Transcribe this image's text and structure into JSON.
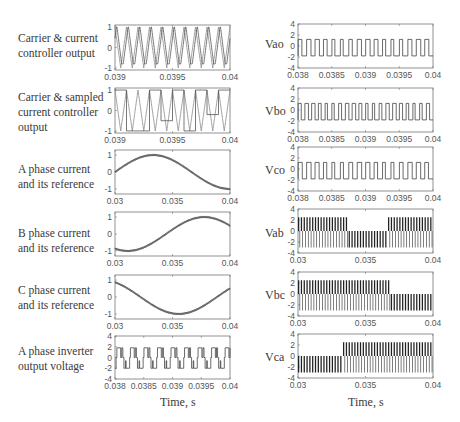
{
  "left_labels": [
    {
      "line1": "Carrier & current",
      "line2": "controller output",
      "line3": ""
    },
    {
      "line1": "Carrier & sampled",
      "line2": "current  controller",
      "line3": "output"
    },
    {
      "line1": "A phase current",
      "line2": "and its reference",
      "line3": ""
    },
    {
      "line1": "B phase current",
      "line2": "and its reference",
      "line3": ""
    },
    {
      "line1": "C phase current",
      "line2": "and its reference",
      "line3": ""
    },
    {
      "line1": "A phase inverter",
      "line2": "output voltage",
      "line3": ""
    }
  ],
  "right_labels": [
    "Vao",
    "Vbo",
    "Vco",
    "Vab",
    "Vbc",
    "Vca"
  ],
  "x_titles": {
    "left": "Time, s",
    "right": "Time, s"
  },
  "chart_data": [
    {
      "id": "carrier-current",
      "type": "line",
      "title": "Carrier & current controller output",
      "xlim": [
        0.039,
        0.04
      ],
      "ylim": [
        -1.1,
        1.1
      ],
      "xticks": [
        "0.039",
        "0.0395",
        "0.04"
      ],
      "yticks": [
        "-1",
        "0",
        "1"
      ],
      "series": [
        {
          "name": "triangular carrier"
        },
        {
          "name": "current controller output"
        }
      ]
    },
    {
      "id": "carrier-sampled",
      "type": "line",
      "title": "Carrier & sampled current controller output",
      "xlim": [
        0.039,
        0.04
      ],
      "ylim": [
        -1.1,
        1.1
      ],
      "xticks": [
        "0.039",
        "0.0395",
        "0.04"
      ],
      "yticks": [
        "-1",
        "0",
        "1"
      ],
      "series": [
        {
          "name": "triangular carrier"
        },
        {
          "name": "sampled controller output"
        }
      ]
    },
    {
      "id": "ia",
      "type": "line",
      "title": "A phase current and its reference",
      "xlim": [
        0.03,
        0.04
      ],
      "ylim": [
        -1.3,
        1.3
      ],
      "xticks": [
        "0.03",
        "0.035",
        "0.04"
      ],
      "yticks": [
        "-1",
        "0",
        "1"
      ],
      "series": [
        {
          "name": "ia",
          "phase_deg": 0
        }
      ]
    },
    {
      "id": "ib",
      "type": "line",
      "title": "B phase current and its reference",
      "xlim": [
        0.03,
        0.04
      ],
      "ylim": [
        -1.3,
        1.3
      ],
      "xticks": [
        "0.03",
        "0.035",
        "0.04"
      ],
      "yticks": [
        "-1",
        "0",
        "1"
      ],
      "series": [
        {
          "name": "ib",
          "phase_deg": -120
        }
      ]
    },
    {
      "id": "ic",
      "type": "line",
      "title": "C phase current and its reference",
      "xlim": [
        0.03,
        0.04
      ],
      "ylim": [
        -1.3,
        1.3
      ],
      "xticks": [
        "0.03",
        "0.035",
        "0.04"
      ],
      "yticks": [
        "-1",
        "0",
        "1"
      ],
      "series": [
        {
          "name": "ic",
          "phase_deg": 120
        }
      ]
    },
    {
      "id": "va",
      "type": "line",
      "title": "A phase inverter output voltage",
      "xlim": [
        0.038,
        0.04
      ],
      "ylim": [
        -4,
        4
      ],
      "xticks": [
        "0.038",
        "0.0385",
        "0.039",
        "0.0395",
        "0.04"
      ],
      "yticks": [
        "-4",
        "-2",
        "0",
        "2",
        "4"
      ],
      "xlabel": "Time, s"
    },
    {
      "id": "vao",
      "type": "line",
      "title": "Vao",
      "xlim": [
        0.038,
        0.04
      ],
      "ylim": [
        -4,
        4
      ],
      "xticks": [
        "0.038",
        "0.0385",
        "0.039",
        "0.0395",
        "0.04"
      ],
      "yticks": [
        "-4",
        "-2",
        "0",
        "2",
        "4"
      ],
      "levels": [
        1.2,
        -1.8
      ]
    },
    {
      "id": "vbo",
      "type": "line",
      "title": "Vbo",
      "xlim": [
        0.038,
        0.04
      ],
      "ylim": [
        -4,
        4
      ],
      "xticks": [
        "0.038",
        "0.0385",
        "0.039",
        "0.0395",
        "0.04"
      ],
      "yticks": [
        "-4",
        "-2",
        "0",
        "2",
        "4"
      ],
      "levels": [
        1.2,
        -1.8
      ]
    },
    {
      "id": "vco",
      "type": "line",
      "title": "Vco",
      "xlim": [
        0.038,
        0.04
      ],
      "ylim": [
        -4,
        4
      ],
      "xticks": [
        "0.038",
        "0.0385",
        "0.039",
        "0.0395",
        "0.04"
      ],
      "yticks": [
        "-4",
        "-2",
        "0",
        "2",
        "4"
      ],
      "levels": [
        1.2,
        -1.8
      ]
    },
    {
      "id": "vab",
      "type": "line",
      "title": "Vab",
      "xlim": [
        0.03,
        0.04
      ],
      "ylim": [
        -4,
        4
      ],
      "xticks": [
        "0.03",
        "0.035",
        "0.04"
      ],
      "yticks": [
        "-4",
        "-2",
        "0",
        "2",
        "4"
      ],
      "levels": [
        2.5,
        0,
        -3
      ]
    },
    {
      "id": "vbc",
      "type": "line",
      "title": "Vbc",
      "xlim": [
        0.03,
        0.04
      ],
      "ylim": [
        -4,
        4
      ],
      "xticks": [
        "0.03",
        "0.035",
        "0.04"
      ],
      "yticks": [
        "-4",
        "-2",
        "0",
        "2",
        "4"
      ],
      "levels": [
        2.5,
        0,
        -3
      ]
    },
    {
      "id": "vca",
      "type": "line",
      "title": "Vca",
      "xlim": [
        0.03,
        0.04
      ],
      "ylim": [
        -4,
        4
      ],
      "xticks": [
        "0.03",
        "0.035",
        "0.04"
      ],
      "yticks": [
        "-4",
        "-2",
        "0",
        "2",
        "4"
      ],
      "levels": [
        2.5,
        0,
        -3
      ],
      "xlabel": "Time, s"
    }
  ]
}
